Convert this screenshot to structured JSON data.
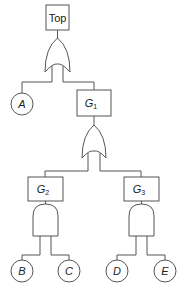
{
  "diagram": {
    "type": "fault-tree",
    "colors": {
      "stroke": "#555555",
      "text": "#222222",
      "background": "#ffffff"
    },
    "top_event": {
      "label": "Top"
    },
    "gates": [
      {
        "id": "or_top",
        "kind": "OR",
        "output": "Top",
        "inputs": [
          "A",
          "G1"
        ]
      },
      {
        "id": "or_g1",
        "kind": "OR",
        "output": "G1",
        "inputs": [
          "G2",
          "G3"
        ]
      },
      {
        "id": "and_g2",
        "kind": "AND",
        "output": "G2",
        "inputs": [
          "B",
          "C"
        ]
      },
      {
        "id": "and_g3",
        "kind": "AND",
        "output": "G3",
        "inputs": [
          "D",
          "E"
        ]
      }
    ],
    "intermediate_events": [
      {
        "id": "G1",
        "letter": "G",
        "sub": "1"
      },
      {
        "id": "G2",
        "letter": "G",
        "sub": "2"
      },
      {
        "id": "G3",
        "letter": "G",
        "sub": "3"
      }
    ],
    "basic_events": [
      {
        "id": "A",
        "label": "A"
      },
      {
        "id": "B",
        "label": "B"
      },
      {
        "id": "C",
        "label": "C"
      },
      {
        "id": "D",
        "label": "D"
      },
      {
        "id": "E",
        "label": "E"
      }
    ]
  }
}
